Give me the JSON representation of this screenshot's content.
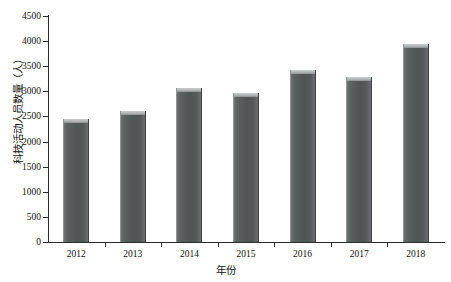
{
  "chart_data": {
    "type": "bar",
    "title": "",
    "xlabel": "年份",
    "ylabel": "科技活动人员数量（人）",
    "categories": [
      "2012",
      "2013",
      "2014",
      "2015",
      "2016",
      "2017",
      "2018"
    ],
    "values": [
      2450,
      2610,
      3070,
      2970,
      3430,
      3290,
      3940
    ],
    "ylim": [
      0,
      4500
    ],
    "ytick_labels": [
      "0",
      "500",
      "1000",
      "1500",
      "2000",
      "2500",
      "3000",
      "3500",
      "4000",
      "4500"
    ],
    "ytick_values": [
      0,
      500,
      1000,
      1500,
      2000,
      2500,
      3000,
      3500,
      4000,
      4500
    ],
    "grid": false,
    "legend": "none",
    "series": [
      {
        "name": "科技活动人员数量（人）",
        "values": [
          2450,
          2610,
          3070,
          2970,
          3430,
          3290,
          3940
        ],
        "color": "#55595a"
      }
    ]
  },
  "axes": {
    "axis_color": "#2b2b2b",
    "background": "#ffffff"
  }
}
